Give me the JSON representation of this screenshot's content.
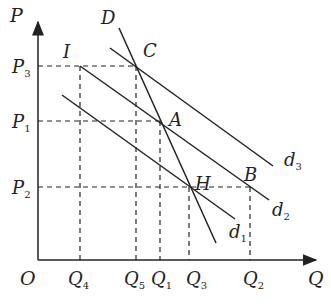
{
  "diagram": {
    "axes": {
      "origin_label": "O",
      "y_label": "P",
      "x_label": "Q"
    },
    "price_levels": [
      {
        "name": "P",
        "sub": "3",
        "y": 66
      },
      {
        "name": "P",
        "sub": "1",
        "y": 121
      },
      {
        "name": "P",
        "sub": "2",
        "y": 187
      }
    ],
    "quantity_levels": [
      {
        "name": "Q",
        "sub": "4",
        "x": 80
      },
      {
        "name": "Q",
        "sub": "5",
        "x": 136
      },
      {
        "name": "Q",
        "sub": "1",
        "x": 160
      },
      {
        "name": "Q",
        "sub": "3",
        "x": 189
      },
      {
        "name": "Q",
        "sub": "2",
        "x": 250
      }
    ],
    "points": [
      {
        "label": "I",
        "x": 80,
        "y": 66
      },
      {
        "label": "C",
        "x": 136,
        "y": 66
      },
      {
        "label": "A",
        "x": 160,
        "y": 121
      },
      {
        "label": "H",
        "x": 190,
        "y": 187
      },
      {
        "label": "B",
        "x": 250,
        "y": 187
      }
    ],
    "curves": [
      {
        "name": "D",
        "label": "D",
        "sub": ""
      },
      {
        "name": "d1",
        "label": "d",
        "sub": "1"
      },
      {
        "name": "d2",
        "label": "d",
        "sub": "2"
      },
      {
        "name": "d3",
        "label": "d",
        "sub": "3"
      }
    ],
    "colors": {
      "line": "#222222",
      "background": "#ffffff"
    }
  }
}
